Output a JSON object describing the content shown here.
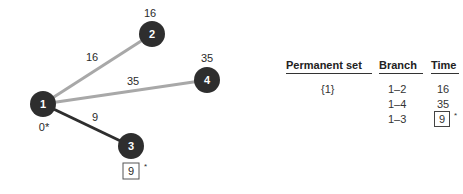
{
  "diagram": {
    "colors": {
      "node_fill": "#2e2e2e",
      "edge_permanent": "#2e2e2e",
      "edge_tentative": "#a8a8a8",
      "text": "#2a2a2a"
    },
    "nodes": [
      {
        "id": "1",
        "label": "1",
        "value": "0*",
        "permanent": true
      },
      {
        "id": "2",
        "label": "2",
        "value": "16",
        "permanent": false
      },
      {
        "id": "3",
        "label": "3",
        "value": "9",
        "star": "*",
        "permanent": true,
        "boxed": true
      },
      {
        "id": "4",
        "label": "4",
        "value": "35",
        "permanent": false
      }
    ],
    "edges": [
      {
        "from": "1",
        "to": "2",
        "label": "16",
        "status": "tentative"
      },
      {
        "from": "1",
        "to": "4",
        "label": "35",
        "status": "tentative"
      },
      {
        "from": "1",
        "to": "3",
        "label": "9",
        "status": "permanent"
      }
    ]
  },
  "table": {
    "headers": {
      "permanent_set": "Permanent set",
      "branch": "Branch",
      "time": "Time"
    },
    "rows": [
      {
        "permanent_set": "{1}",
        "branch": "1–2",
        "time": "16"
      },
      {
        "permanent_set": "",
        "branch": "1–4",
        "time": "35"
      },
      {
        "permanent_set": "",
        "branch": "1–3",
        "time": "9",
        "boxed": true,
        "star": "*"
      }
    ]
  }
}
